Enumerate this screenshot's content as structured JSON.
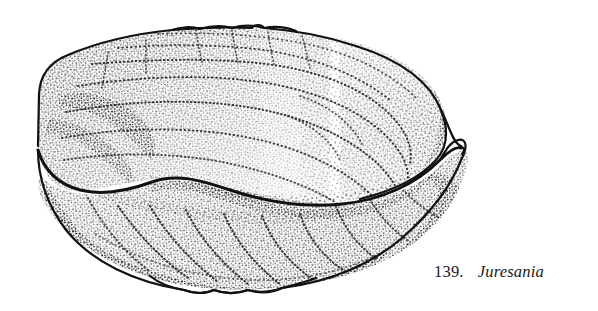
{
  "figure": {
    "caption_number": "139.",
    "genus": "Juresania",
    "technique": "stipple-pen-and-ink",
    "ink_color": "#111111",
    "background_color": "#ffffff"
  },
  "specimen": {
    "upper_valve_name": "pedicle-valve",
    "lower_valve_name": "brachial-valve",
    "commissure_name": "commissure-line"
  }
}
